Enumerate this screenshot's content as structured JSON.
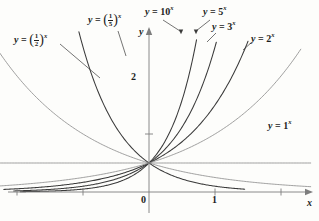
{
  "figure": {
    "type": "exponential-functions-graph",
    "background": "#fdfdfb",
    "curve_color": "#3a3a3a",
    "light_curve_color": "#8f8f8f",
    "axis_color": "#7d7d7d"
  },
  "axes": {
    "x_label": "x",
    "y_label": "y",
    "x_ticks": [
      {
        "label": "",
        "value": -2
      },
      {
        "label": "",
        "value": -1
      },
      {
        "label": "0",
        "value": 0
      },
      {
        "label": "1",
        "value": 1
      },
      {
        "label": "",
        "value": 2
      }
    ],
    "y_ticks": [
      {
        "label": "2",
        "value": 2
      }
    ],
    "x_origin_px": 149,
    "y_origin_px": 192,
    "px_per_x_unit": 66,
    "px_per_y_unit": 29,
    "xlim": [
      -2.3,
      2.45
    ],
    "ylim": [
      0,
      5.6
    ]
  },
  "labels": {
    "half": {
      "lhs": "y",
      "op": "=",
      "num": "1",
      "den": "2",
      "exp": "x"
    },
    "fifth": {
      "lhs": "y",
      "op": "=",
      "num": "1",
      "den": "5",
      "exp": "x"
    },
    "ten": {
      "lhs": "y",
      "op": "=",
      "base": "10",
      "exp": "x"
    },
    "five": {
      "lhs": "y",
      "op": "=",
      "base": "5",
      "exp": "x"
    },
    "three": {
      "lhs": "y",
      "op": "=",
      "base": "3",
      "exp": "x"
    },
    "two": {
      "lhs": "y",
      "op": "=",
      "base": "2",
      "exp": "x"
    },
    "one": {
      "lhs": "y",
      "op": "=",
      "base": "1",
      "exp": "x"
    }
  },
  "chart_data": {
    "type": "line",
    "title": "",
    "xlabel": "x",
    "ylabel": "y",
    "xlim": [
      -2.3,
      2.45
    ],
    "ylim": [
      0,
      5.6
    ],
    "grid": false,
    "legend": "inline-annotations",
    "common_point": [
      0,
      1
    ],
    "series": [
      {
        "name": "y = (1/2)^x",
        "base": 0.5,
        "style": "light",
        "x_range": [
          -2.3,
          2.45
        ],
        "points": [
          {
            "x": -2.3,
            "y": 4.925
          },
          {
            "x": -2.0,
            "y": 4.0
          },
          {
            "x": -1.5,
            "y": 2.828
          },
          {
            "x": -1.0,
            "y": 2.0
          },
          {
            "x": -0.5,
            "y": 1.414
          },
          {
            "x": 0.0,
            "y": 1.0
          },
          {
            "x": 0.5,
            "y": 0.707
          },
          {
            "x": 1.0,
            "y": 0.5
          },
          {
            "x": 1.5,
            "y": 0.354
          },
          {
            "x": 2.0,
            "y": 0.25
          },
          {
            "x": 2.45,
            "y": 0.183
          }
        ]
      },
      {
        "name": "y = (1/5)^x",
        "base": 0.2,
        "style": "dark",
        "x_range": [
          -1.75,
          1.45
        ],
        "points": [
          {
            "x": -1.75,
            "y": 11.18
          },
          {
            "x": -1.5,
            "y": 5.59
          },
          {
            "x": -1.25,
            "y": 3.344
          },
          {
            "x": -1.0,
            "y": 5.0
          },
          {
            "x": -0.5,
            "y": 2.236
          },
          {
            "x": 0.0,
            "y": 1.0
          },
          {
            "x": 0.5,
            "y": 0.447
          },
          {
            "x": 1.0,
            "y": 0.2
          },
          {
            "x": 1.45,
            "y": 0.098
          }
        ]
      },
      {
        "name": "y = 10^x",
        "base": 10,
        "style": "dark",
        "x_range": [
          -1.95,
          0.72
        ],
        "points": [
          {
            "x": -1.95,
            "y": 0.011
          },
          {
            "x": -1.5,
            "y": 0.032
          },
          {
            "x": -1.0,
            "y": 0.1
          },
          {
            "x": -0.5,
            "y": 0.316
          },
          {
            "x": 0.0,
            "y": 1.0
          },
          {
            "x": 0.5,
            "y": 3.162
          },
          {
            "x": 0.72,
            "y": 5.25
          }
        ]
      },
      {
        "name": "y = 5^x",
        "base": 5,
        "style": "dark",
        "x_range": [
          -2.05,
          1.02
        ],
        "points": [
          {
            "x": -2.05,
            "y": 0.036
          },
          {
            "x": -1.5,
            "y": 0.089
          },
          {
            "x": -1.0,
            "y": 0.2
          },
          {
            "x": -0.5,
            "y": 0.447
          },
          {
            "x": 0.0,
            "y": 1.0
          },
          {
            "x": 0.5,
            "y": 2.236
          },
          {
            "x": 1.02,
            "y": 5.22
          }
        ]
      },
      {
        "name": "y = 3^x",
        "base": 3,
        "style": "dark",
        "x_range": [
          -2.2,
          1.5
        ],
        "points": [
          {
            "x": -2.2,
            "y": 0.093
          },
          {
            "x": -1.5,
            "y": 0.192
          },
          {
            "x": -1.0,
            "y": 0.333
          },
          {
            "x": -0.5,
            "y": 0.577
          },
          {
            "x": 0.0,
            "y": 1.0
          },
          {
            "x": 0.5,
            "y": 1.732
          },
          {
            "x": 1.0,
            "y": 3.0
          },
          {
            "x": 1.5,
            "y": 5.196
          }
        ]
      },
      {
        "name": "y = 2^x",
        "base": 2,
        "style": "light",
        "x_range": [
          -2.3,
          2.3
        ],
        "points": [
          {
            "x": -2.3,
            "y": 0.203
          },
          {
            "x": -2.0,
            "y": 0.25
          },
          {
            "x": -1.0,
            "y": 0.5
          },
          {
            "x": 0.0,
            "y": 1.0
          },
          {
            "x": 1.0,
            "y": 2.0
          },
          {
            "x": 1.7,
            "y": 3.249
          },
          {
            "x": 2.3,
            "y": 4.925
          }
        ]
      },
      {
        "name": "y = 1^x",
        "base": 1,
        "style": "light",
        "x_range": [
          -2.3,
          2.45
        ],
        "points": [
          {
            "x": -2.3,
            "y": 1.0
          },
          {
            "x": 2.45,
            "y": 1.0
          }
        ]
      }
    ]
  }
}
